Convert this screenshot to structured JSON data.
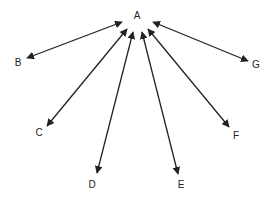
{
  "colors": {
    "line": "#222222",
    "text": "#222222",
    "background": "#ffffff"
  },
  "center": {
    "label": "A",
    "x": 137,
    "y": 19
  },
  "nodes": [
    {
      "label": "B",
      "lx": 18,
      "ly": 66,
      "x1": 122,
      "y1": 22,
      "x2": 27,
      "y2": 58
    },
    {
      "label": "C",
      "lx": 39,
      "ly": 136,
      "x1": 127,
      "y1": 29,
      "x2": 47,
      "y2": 126
    },
    {
      "label": "D",
      "lx": 92,
      "ly": 188,
      "x1": 133,
      "y1": 32,
      "x2": 97,
      "y2": 173
    },
    {
      "label": "E",
      "lx": 181,
      "ly": 188,
      "x1": 142,
      "y1": 32,
      "x2": 178,
      "y2": 174
    },
    {
      "label": "F",
      "lx": 236,
      "ly": 139,
      "x1": 148,
      "y1": 29,
      "x2": 229,
      "y2": 127
    },
    {
      "label": "G",
      "lx": 256,
      "ly": 68,
      "x1": 153,
      "y1": 22,
      "x2": 248,
      "y2": 61
    }
  ]
}
